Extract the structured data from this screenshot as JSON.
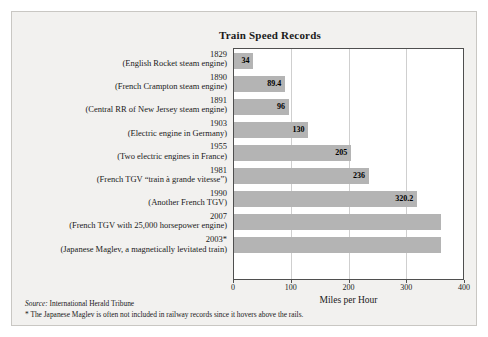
{
  "figure": {
    "background_color": "#f2f1ef",
    "bar_color": "#b4b4b4",
    "frame_color": "#4f4f4f"
  },
  "chart_data": {
    "type": "bar",
    "orientation": "horizontal",
    "title": "Train Speed Records",
    "xlabel": "Miles per Hour",
    "ylabel": "",
    "xlim": [
      0,
      400
    ],
    "xticks": [
      0,
      100,
      200,
      300,
      400
    ],
    "grid": true,
    "grid_axis": "x",
    "legend": false,
    "categories": [
      "1829\n(English Rocket steam engine)",
      "1890\n(French Crampton steam engine)",
      "1891\n(Central RR of New Jersey steam engine)",
      "1903\n(Electric engine in Germany)",
      "1955\n(Two electric engines in France)",
      "1981\n(French TGV “train à grande vitesse”)",
      "1990\n(Another French TGV)",
      "2007\n(French TGV with 25,000 horsepower engine)",
      "2003*\n(Japanese Maglev, a magnetically levitated train)"
    ],
    "values": [
      34,
      89.4,
      96,
      130,
      205,
      236,
      320.2,
      361,
      361
    ],
    "data_labels": [
      "34",
      "89.4",
      "96",
      "130",
      "205",
      "236",
      "320.2",
      "",
      ""
    ],
    "annotations": [
      "Source: International Herald Tribune",
      "* The Japanese Maglev is often not included in railway records since it hovers above the rails."
    ]
  },
  "rows": [
    {
      "year": "1829",
      "desc": "(English Rocket steam engine)",
      "value": 34,
      "label": "34"
    },
    {
      "year": "1890",
      "desc": "(French Crampton steam engine)",
      "value": 89.4,
      "label": "89.4"
    },
    {
      "year": "1891",
      "desc": "(Central RR of New Jersey steam engine)",
      "value": 96,
      "label": "96"
    },
    {
      "year": "1903",
      "desc": "(Electric engine in Germany)",
      "value": 130,
      "label": "130"
    },
    {
      "year": "1955",
      "desc": "(Two electric engines in France)",
      "value": 205,
      "label": "205"
    },
    {
      "year": "1981",
      "desc": "(French TGV “train à grande vitesse”)",
      "value": 236,
      "label": "236"
    },
    {
      "year": "1990",
      "desc": "(Another French TGV)",
      "value": 320.2,
      "label": "320.2"
    },
    {
      "year": "2007",
      "desc": "(French TGV with 25,000 horsepower engine)",
      "value": 361,
      "label": ""
    },
    {
      "year": "2003*",
      "desc": "(Japanese Maglev, a magnetically levitated train)",
      "value": 361,
      "label": ""
    }
  ],
  "axis": {
    "ticks": [
      "0",
      "100",
      "200",
      "300",
      "400"
    ],
    "title": "Miles per Hour"
  },
  "footnotes": {
    "source_label": "Source:",
    "source_value": " International Herald Tribune",
    "asterisk_note": "* The Japanese Maglev is often not included in railway records since it hovers above the rails."
  }
}
